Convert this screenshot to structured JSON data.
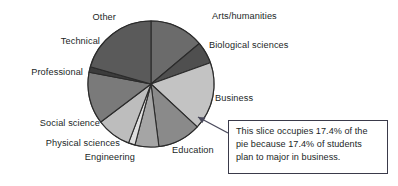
{
  "chart_data": {
    "type": "pie",
    "title": "",
    "xlabel": "",
    "ylabel": "",
    "legend_position": "none",
    "grid": false,
    "units": "percent",
    "start_angle_deg": 0,
    "direction": "clockwise",
    "categories": [
      "Arts/humanities",
      "Biological sciences",
      "Business",
      "Education",
      "Engineering",
      "Physical sciences",
      "Social science",
      "Professional",
      "Technical",
      "Other"
    ],
    "values": [
      13.9,
      5.6,
      17.4,
      11.1,
      6.1,
      1.7,
      8.9,
      13.3,
      1.4,
      20.6
    ],
    "colors": [
      "#6b6b6b",
      "#4f4f4f",
      "#c3c3c3",
      "#8a8a8a",
      "#a5a5a5",
      "#dedede",
      "#bdbdbd",
      "#7a7a7a",
      "#3c3c3c",
      "#5a5a5a"
    ],
    "slice_labels": [
      "Arts/humanities",
      "Biological sciences",
      "Business",
      "Education",
      "Engineering",
      "Physical sciences",
      "Social science",
      "Professional",
      "Technical",
      "Other"
    ],
    "annotations": [
      {
        "target_category": "Business",
        "target_value": 17.4,
        "text": "This slice occupies 17.4% of the pie because 17.4% of students plan to major in business."
      }
    ]
  },
  "callout": {
    "line1": "This slice occupies 17.4% of the",
    "line2": "pie because 17.4% of students",
    "line3": "plan to major in business."
  },
  "labels": {
    "arts_humanities": "Arts/humanities",
    "biological_sciences": "Biological sciences",
    "business": "Business",
    "education": "Education",
    "engineering": "Engineering",
    "physical_sciences": "Physical sciences",
    "social_science": "Social science",
    "professional": "Professional",
    "technical": "Technical",
    "other": "Other"
  },
  "geometry": {
    "center_x": 151,
    "center_y": 84,
    "radius": 63,
    "stroke": "#2b2b2b"
  }
}
